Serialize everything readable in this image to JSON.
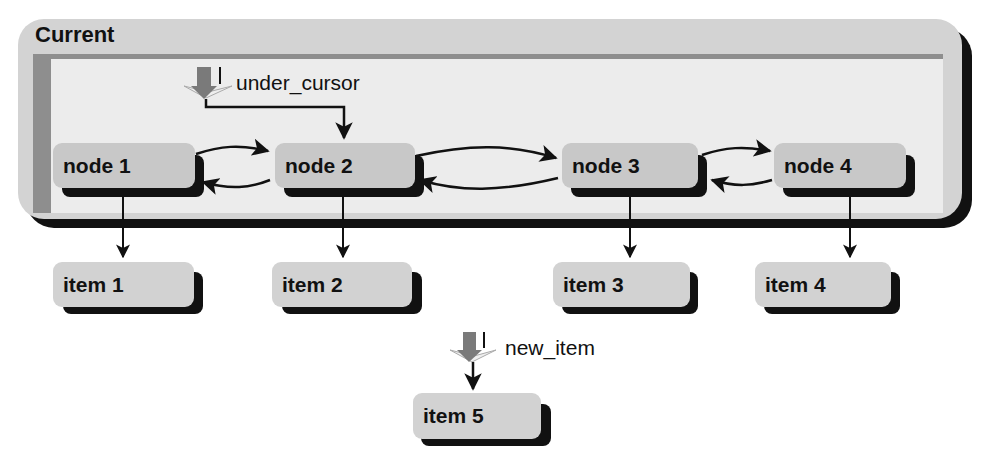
{
  "container": {
    "title": "Current"
  },
  "nodes": [
    {
      "label": "node 1"
    },
    {
      "label": "node 2"
    },
    {
      "label": "node 3"
    },
    {
      "label": "node 4"
    }
  ],
  "items": [
    {
      "label": "item 1"
    },
    {
      "label": "item 2"
    },
    {
      "label": "item 3"
    },
    {
      "label": "item 4"
    },
    {
      "label": "item 5"
    }
  ],
  "pointers": {
    "under_cursor": {
      "label": "under_cursor",
      "points_to": "node 2"
    },
    "new_item": {
      "label": "new_item",
      "points_to": "item 5"
    }
  },
  "links": {
    "node_to_node_bidirectional": [
      [
        "node 1",
        "node 2"
      ],
      [
        "node 2",
        "node 3"
      ],
      [
        "node 3",
        "node 4"
      ]
    ],
    "node_to_item": [
      [
        "node 1",
        "item 1"
      ],
      [
        "node 2",
        "item 2"
      ],
      [
        "node 3",
        "item 3"
      ],
      [
        "node 4",
        "item 4"
      ]
    ]
  },
  "colors": {
    "container_fill": "#d3d3d3",
    "panel_fill": "#ececec",
    "panel_border": "#8e8e8e",
    "box_fill": "#c8c8c8",
    "shadow": "#111111",
    "pointer_fill": "#7a7a7a"
  }
}
